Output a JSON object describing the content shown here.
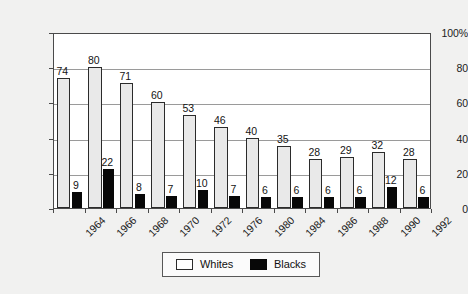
{
  "chart_data": {
    "type": "bar",
    "title": "",
    "subtitle": "",
    "xlabel": "",
    "ylabel": "",
    "categories": [
      "1964",
      "1966",
      "1968",
      "1970",
      "1972",
      "1976",
      "1980",
      "1984",
      "1986",
      "1988",
      "1990",
      "1992"
    ],
    "series": [
      {
        "name": "Whites",
        "color": "#e9e9e9",
        "values": [
          74,
          80,
          71,
          60,
          53,
          46,
          40,
          35,
          28,
          29,
          32,
          28
        ]
      },
      {
        "name": "Blacks",
        "color": "#080808",
        "values": [
          9,
          22,
          8,
          7,
          10,
          7,
          6,
          6,
          6,
          6,
          12,
          6
        ]
      }
    ],
    "ylim": [
      0,
      100
    ],
    "yticks": [
      0,
      20,
      40,
      60,
      80,
      100
    ],
    "ytick_labels": [
      "0",
      "20",
      "40",
      "60",
      "80",
      "100%"
    ],
    "grid": true,
    "grid_axis": "y",
    "legend_position": "bottom-center",
    "data_labels": true
  },
  "legend": {
    "entries": [
      {
        "label": "Whites",
        "swatch": "white-square"
      },
      {
        "label": "Blacks",
        "swatch": "black-square"
      }
    ]
  },
  "colors": {
    "background": "#f1f1f0",
    "plot_background": "#ffffff",
    "axis": "#4a4a4a",
    "gridline": "#9a9a9a",
    "whites_bar": "#e9e9e9",
    "blacks_bar": "#080808",
    "text": "#141414"
  }
}
